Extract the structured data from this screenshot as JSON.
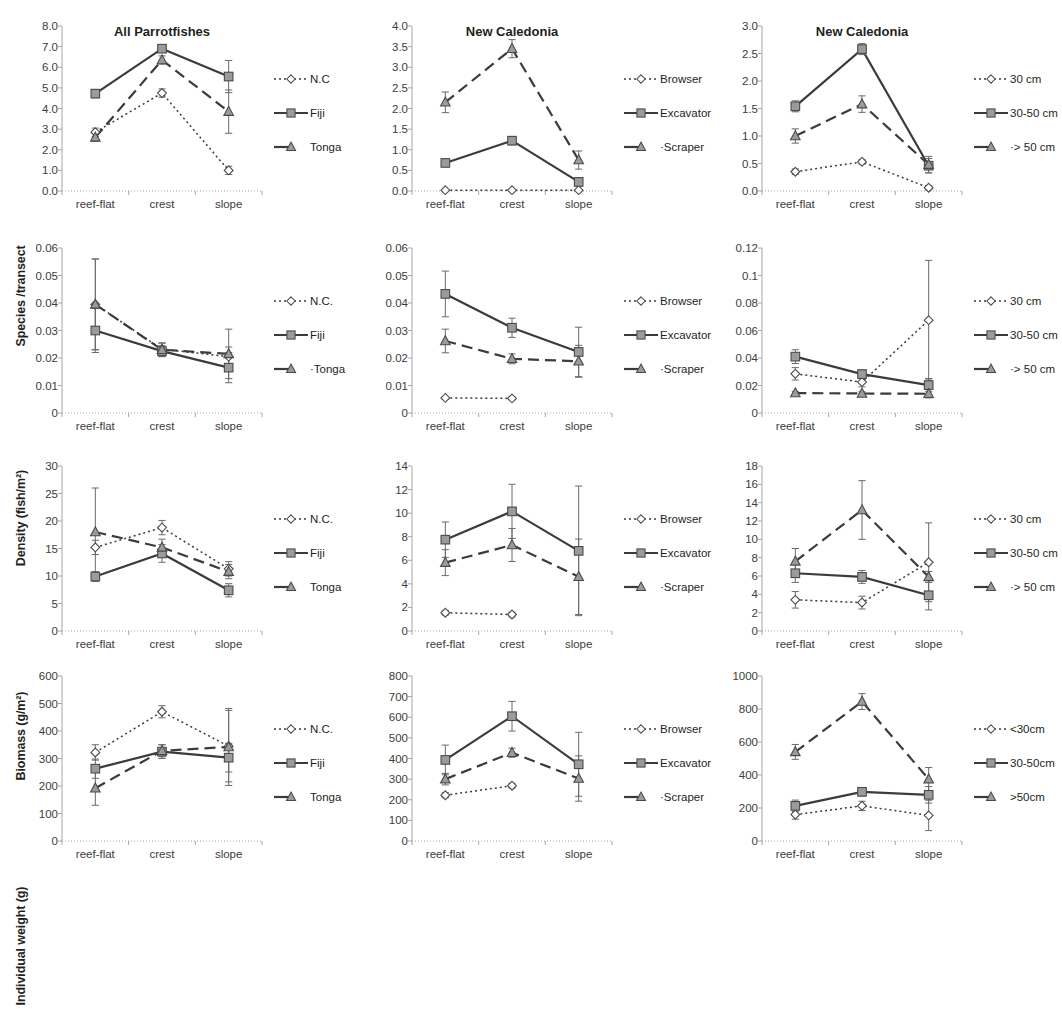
{
  "figure": {
    "columns": 3,
    "rows": 4,
    "categories": [
      "reef-flat",
      "crest",
      "slope"
    ],
    "colors": {
      "line": "#3b3b3b",
      "marker_fill": "#9b9b9b",
      "marker_fill_open": "#ffffff",
      "text": "#231f20",
      "axis": "#a6a6a6"
    },
    "series_styles": {
      "s1": {
        "dash": "2,3",
        "marker": "diamond",
        "fill": "open"
      },
      "s2": {
        "dash": "none",
        "marker": "square",
        "fill": "gray"
      },
      "s3": {
        "dash": "11,6",
        "marker": "triangle",
        "fill": "gray"
      }
    }
  },
  "chart_data": [
    {
      "id": "p1",
      "type": "line",
      "title": "All Parrotfishes",
      "xlabel": "",
      "ylabel": "Species /transect",
      "categories": [
        "reef-flat",
        "crest",
        "slope"
      ],
      "ylim": [
        0,
        8
      ],
      "yticks": [
        "0.0",
        "1.0",
        "2.0",
        "3.0",
        "4.0",
        "5.0",
        "6.0",
        "7.0",
        "8.0"
      ],
      "ytick_values": [
        0,
        1,
        2,
        3,
        4,
        5,
        6,
        7,
        8
      ],
      "grid": false,
      "legend_position": "right",
      "series": [
        {
          "name": "N.C",
          "style": "s1",
          "values": [
            2.85,
            4.75,
            1.0
          ],
          "errors": [
            0.2,
            0.2,
            0.2
          ]
        },
        {
          "name": "Fiji",
          "style": "s2",
          "values": [
            4.72,
            6.9,
            5.55
          ],
          "errors": [
            0.2,
            0.15,
            0.78
          ]
        },
        {
          "name": "Tonga",
          "style": "s3",
          "values": [
            2.6,
            6.35,
            3.85
          ],
          "errors": [
            0.2,
            0.2,
            1.05
          ]
        }
      ]
    },
    {
      "id": "p2",
      "type": "line",
      "title": "New Caledonia",
      "xlabel": "",
      "ylabel": "",
      "categories": [
        "reef-flat",
        "crest",
        "slope"
      ],
      "ylim": [
        0,
        4
      ],
      "yticks": [
        "0.0",
        "0.5",
        "1.0",
        "1.5",
        "2.0",
        "2.5",
        "3.0",
        "3.5",
        "4.0"
      ],
      "ytick_values": [
        0,
        0.5,
        1,
        1.5,
        2,
        2.5,
        3,
        3.5,
        4
      ],
      "grid": false,
      "legend_position": "right",
      "series": [
        {
          "name": "Browser",
          "style": "s1",
          "values": [
            0.02,
            0.02,
            0.02
          ],
          "errors": [
            0,
            0,
            0
          ]
        },
        {
          "name": "Excavator",
          "style": "s2",
          "values": [
            0.68,
            1.22,
            0.22
          ],
          "errors": [
            0.07,
            0.1,
            0.1
          ]
        },
        {
          "name": "Scraper",
          "style": "s3",
          "values": [
            2.15,
            3.45,
            0.75
          ],
          "errors": [
            0.25,
            0.22,
            0.22
          ]
        }
      ]
    },
    {
      "id": "p3",
      "type": "line",
      "title": "New Caledonia",
      "xlabel": "",
      "ylabel": "",
      "categories": [
        "reef-flat",
        "crest",
        "slope"
      ],
      "ylim": [
        0,
        3
      ],
      "yticks": [
        "0.0",
        "0.5",
        "1.0",
        "1.5",
        "2.0",
        "2.5",
        "3.0"
      ],
      "ytick_values": [
        0,
        0.5,
        1,
        1.5,
        2,
        2.5,
        3
      ],
      "grid": false,
      "legend_position": "right",
      "series": [
        {
          "name": "30 cm",
          "style": "s1",
          "values": [
            0.35,
            0.53,
            0.06
          ],
          "errors": [
            0.05,
            0.04,
            0.04
          ]
        },
        {
          "name": "30-50 cm",
          "style": "s2",
          "values": [
            1.54,
            2.58,
            0.46
          ],
          "errors": [
            0.1,
            0.1,
            0.13
          ]
        },
        {
          "name": "> 50 cm",
          "style": "s3",
          "values": [
            1.0,
            1.58,
            0.48
          ],
          "errors": [
            0.13,
            0.15,
            0.15
          ]
        }
      ]
    },
    {
      "id": "p4",
      "type": "line",
      "title": "",
      "xlabel": "",
      "ylabel": "Density (fish/m²)",
      "categories": [
        "reef-flat",
        "crest",
        "slope"
      ],
      "ylim": [
        0,
        0.06
      ],
      "yticks": [
        "0",
        "0.01",
        "0.02",
        "0.03",
        "0.04",
        "0.05",
        "0.06"
      ],
      "ytick_values": [
        0,
        0.01,
        0.02,
        0.03,
        0.04,
        0.05,
        0.06
      ],
      "grid": false,
      "legend_position": "right",
      "series": [
        {
          "name": "N.C.",
          "style": "s1",
          "values": [
            0.0395,
            0.0232,
            0.0205
          ],
          "errors": [
            0.0165,
            0.0022,
            0.0035
          ]
        },
        {
          "name": "Fiji",
          "style": "s2",
          "values": [
            0.03,
            0.0225,
            0.0165
          ],
          "errors": [
            0.008,
            0.002,
            0.0055
          ]
        },
        {
          "name": "Tonga",
          "style": "s3",
          "values": [
            0.0395,
            0.023,
            0.0215
          ],
          "errors": [
            0.0165,
            0.0025,
            0.009
          ]
        }
      ]
    },
    {
      "id": "p5",
      "type": "line",
      "title": "",
      "xlabel": "",
      "ylabel": "",
      "categories": [
        "reef-flat",
        "crest",
        "slope"
      ],
      "ylim": [
        0,
        0.06
      ],
      "yticks": [
        "0",
        "0.01",
        "0.02",
        "0.03",
        "0.04",
        "0.05",
        "0.06"
      ],
      "ytick_values": [
        0,
        0.01,
        0.02,
        0.03,
        0.04,
        0.05,
        0.06
      ],
      "grid": false,
      "legend_position": "right",
      "series": [
        {
          "name": "Browser",
          "style": "s1",
          "values": [
            0.0055,
            0.0053,
            null
          ],
          "errors": [
            0.0005,
            0.0005,
            0
          ]
        },
        {
          "name": "Excavator",
          "style": "s2",
          "values": [
            0.0433,
            0.031,
            0.0222
          ],
          "errors": [
            0.0083,
            0.0035,
            0.009
          ]
        },
        {
          "name": "Scraper",
          "style": "s3",
          "values": [
            0.0262,
            0.0197,
            0.0188
          ],
          "errors": [
            0.0043,
            0.0018,
            0.0058
          ]
        }
      ]
    },
    {
      "id": "p6",
      "type": "line",
      "title": "",
      "xlabel": "",
      "ylabel": "",
      "categories": [
        "reef-flat",
        "crest",
        "slope"
      ],
      "ylim": [
        0,
        0.12
      ],
      "yticks": [
        "0",
        "0.02",
        "0.04",
        "0.06",
        "0.08",
        "0.1",
        "0.12"
      ],
      "ytick_values": [
        0,
        0.02,
        0.04,
        0.06,
        0.08,
        0.1,
        0.12
      ],
      "grid": false,
      "legend_position": "right",
      "series": [
        {
          "name": "30 cm",
          "style": "s1",
          "values": [
            0.0285,
            0.0225,
            0.0675
          ],
          "errors": [
            0.0045,
            0.0035,
            0.0435
          ]
        },
        {
          "name": "30-50 cm",
          "style": "s2",
          "values": [
            0.041,
            0.0283,
            0.0203
          ],
          "errors": [
            0.005,
            0.0028,
            0.0048
          ]
        },
        {
          "name": "> 50 cm",
          "style": "s3",
          "values": [
            0.0145,
            0.0142,
            0.014
          ],
          "errors": [
            0.001,
            0.0012,
            0.003
          ]
        }
      ]
    },
    {
      "id": "p7",
      "type": "line",
      "title": "",
      "xlabel": "",
      "ylabel": "Biomass (g/m²)",
      "categories": [
        "reef-flat",
        "crest",
        "slope"
      ],
      "ylim": [
        0,
        30
      ],
      "yticks": [
        "0",
        "5",
        "10",
        "15",
        "20",
        "25",
        "30"
      ],
      "ytick_values": [
        0,
        5,
        10,
        15,
        20,
        25,
        30
      ],
      "grid": false,
      "legend_position": "right",
      "series": [
        {
          "name": "N.C.",
          "style": "s1",
          "values": [
            15.2,
            18.8,
            11.3
          ],
          "errors": [
            1.3,
            1.3,
            1.3
          ]
        },
        {
          "name": "Fiji",
          "style": "s2",
          "values": [
            9.9,
            14.1,
            7.4
          ],
          "errors": [
            0.9,
            1.6,
            1.2
          ]
        },
        {
          "name": "Tonga",
          "style": "s3",
          "values": [
            18.0,
            15.2,
            10.8
          ],
          "errors": [
            8.0,
            1.5,
            1.3
          ]
        }
      ]
    },
    {
      "id": "p8",
      "type": "line",
      "title": "",
      "xlabel": "",
      "ylabel": "",
      "categories": [
        "reef-flat",
        "crest",
        "slope"
      ],
      "ylim": [
        0,
        14
      ],
      "yticks": [
        "0",
        "2",
        "4",
        "6",
        "8",
        "10",
        "12",
        "14"
      ],
      "ytick_values": [
        0,
        2,
        4,
        6,
        8,
        10,
        12,
        14
      ],
      "grid": false,
      "legend_position": "right",
      "series": [
        {
          "name": "Browser",
          "style": "s1",
          "values": [
            1.55,
            1.4,
            null
          ],
          "errors": [
            0.2,
            0.2,
            0
          ]
        },
        {
          "name": "Excavator",
          "style": "s2",
          "values": [
            7.75,
            10.15,
            6.8
          ],
          "errors": [
            1.5,
            2.3,
            5.5
          ]
        },
        {
          "name": "Scraper",
          "style": "s3",
          "values": [
            5.8,
            7.3,
            4.6
          ],
          "errors": [
            1.1,
            1.4,
            3.2
          ]
        }
      ]
    },
    {
      "id": "p9",
      "type": "line",
      "title": "",
      "xlabel": "",
      "ylabel": "",
      "categories": [
        "reef-flat",
        "crest",
        "slope"
      ],
      "ylim": [
        0,
        18
      ],
      "yticks": [
        "0",
        "2",
        "4",
        "6",
        "8",
        "10",
        "12",
        "14",
        "16",
        "18"
      ],
      "ytick_values": [
        0,
        2,
        4,
        6,
        8,
        10,
        12,
        14,
        16,
        18
      ],
      "grid": false,
      "legend_position": "right",
      "series": [
        {
          "name": "30 cm",
          "style": "s1",
          "values": [
            3.4,
            3.1,
            7.5
          ],
          "errors": [
            0.9,
            0.7,
            4.3
          ]
        },
        {
          "name": "30-50 cm",
          "style": "s2",
          "values": [
            6.3,
            5.9,
            3.9
          ],
          "errors": [
            1.0,
            0.7,
            1.6
          ]
        },
        {
          "name": "> 50 cm",
          "style": "s3",
          "values": [
            7.6,
            13.2,
            5.9
          ],
          "errors": [
            1.4,
            3.2,
            0.6
          ]
        }
      ]
    },
    {
      "id": "p10",
      "type": "line",
      "title": "",
      "xlabel": "",
      "ylabel": "Individual weight (g)",
      "categories": [
        "reef-flat",
        "crest",
        "slope"
      ],
      "ylim": [
        0,
        600
      ],
      "yticks": [
        "0",
        "100",
        "200",
        "300",
        "400",
        "500",
        "600"
      ],
      "ytick_values": [
        0,
        100,
        200,
        300,
        400,
        500,
        600
      ],
      "grid": false,
      "legend_position": "right",
      "series": [
        {
          "name": "N.C.",
          "style": "s1",
          "values": [
            322,
            470,
            345
          ],
          "errors": [
            28,
            22,
            130
          ]
        },
        {
          "name": "Fiji",
          "style": "s2",
          "values": [
            263,
            325,
            303
          ],
          "errors": [
            35,
            25,
            52
          ]
        },
        {
          "name": "Tonga",
          "style": "s3",
          "values": [
            192,
            328,
            342
          ],
          "errors": [
            62,
            22,
            140
          ]
        }
      ]
    },
    {
      "id": "p11",
      "type": "line",
      "title": "",
      "xlabel": "",
      "ylabel": "",
      "categories": [
        "reef-flat",
        "crest",
        "slope"
      ],
      "ylim": [
        0,
        800
      ],
      "yticks": [
        "0",
        "100",
        "200",
        "300",
        "400",
        "500",
        "600",
        "700",
        "800"
      ],
      "ytick_values": [
        0,
        100,
        200,
        300,
        400,
        500,
        600,
        700,
        800
      ],
      "grid": false,
      "legend_position": "right",
      "series": [
        {
          "name": "Browser",
          "style": "s1",
          "values": [
            222,
            268,
            null
          ],
          "errors": [
            12,
            12,
            0
          ]
        },
        {
          "name": "Excavator",
          "style": "s2",
          "values": [
            393,
            605,
            372
          ],
          "errors": [
            72,
            72,
            155
          ]
        },
        {
          "name": "Scraper",
          "style": "s3",
          "values": [
            300,
            428,
            303
          ],
          "errors": [
            28,
            22,
            110
          ]
        }
      ]
    },
    {
      "id": "p12",
      "type": "line",
      "title": "",
      "xlabel": "",
      "ylabel": "",
      "categories": [
        "reef-flat",
        "crest",
        "slope"
      ],
      "ylim": [
        0,
        1000
      ],
      "yticks": [
        "0",
        "200",
        "400",
        "600",
        "800",
        "1000"
      ],
      "ytick_values": [
        0,
        200,
        400,
        600,
        800,
        1000
      ],
      "grid": false,
      "legend_position": "right",
      "series": [
        {
          "name": "<30cm",
          "style": "s1",
          "values": [
            160,
            213,
            155
          ],
          "errors": [
            28,
            28,
            92
          ]
        },
        {
          "name": "30-50cm",
          "style": "s2",
          "values": [
            213,
            298,
            280
          ],
          "errors": [
            35,
            25,
            50
          ]
        },
        {
          "name": ">50cm",
          "style": "s3",
          "values": [
            540,
            845,
            375
          ],
          "errors": [
            45,
            48,
            70
          ]
        }
      ]
    }
  ],
  "panels": [
    {
      "ylabel": "Species /transect",
      "legend": [
        "N.C",
        "Fiji",
        "Tonga"
      ]
    },
    {
      "ylabel": "",
      "legend": [
        "Browser",
        "Excavator",
        "·Scraper"
      ]
    },
    {
      "ylabel": "",
      "legend": [
        "30 cm",
        "30-50 cm",
        "·> 50 cm"
      ]
    },
    {
      "ylabel": "Density (fish/m²)",
      "legend": [
        "N.C.",
        "Fiji",
        "·Tonga"
      ]
    },
    {
      "ylabel": "",
      "legend": [
        "Browser",
        "Excavator",
        "·Scraper"
      ]
    },
    {
      "ylabel": "",
      "legend": [
        "30 cm",
        "30-50 cm",
        "·> 50 cm"
      ]
    },
    {
      "ylabel": "Biomass (g/m²)",
      "legend": [
        "N.C.",
        "Fiji",
        "Tonga"
      ]
    },
    {
      "ylabel": "",
      "legend": [
        "Browser",
        "Excavator",
        "·Scraper"
      ]
    },
    {
      "ylabel": "",
      "legend": [
        "30 cm",
        "30-50 cm",
        "·> 50 cm"
      ]
    },
    {
      "ylabel": "Individual weight (g)",
      "legend": [
        "N.C.",
        "Fiji",
        "Tonga"
      ]
    },
    {
      "ylabel": "",
      "legend": [
        "Browser",
        "Excavator",
        "·Scraper"
      ]
    },
    {
      "ylabel": "",
      "legend": [
        "<30cm",
        "30-50cm",
        ">50cm"
      ]
    }
  ]
}
